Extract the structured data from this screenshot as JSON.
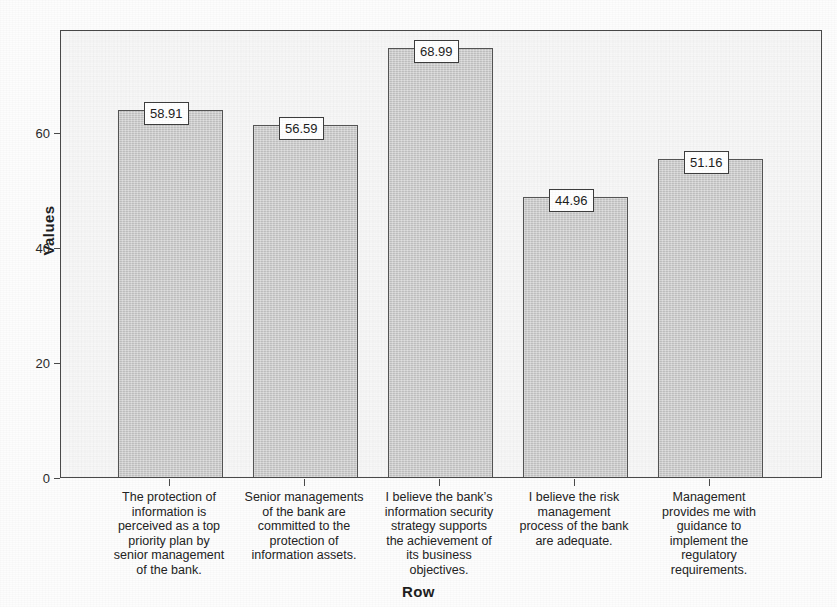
{
  "chart_data": {
    "type": "bar",
    "title": "",
    "xlabel": "Row",
    "ylabel": "Values",
    "ylim": [
      0,
      72
    ],
    "yticks": [
      0,
      20,
      40,
      60
    ],
    "ytick_labels": [
      "0",
      "20",
      "40",
      "60"
    ],
    "grid": false,
    "legend": false,
    "legend_position": "none",
    "categories": [
      "The protection of information is perceived as a top priority plan by senior management of the bank.",
      "Senior managements of the bank are committed to the protection of information assets.",
      "I believe the bank’s information security strategy supports the achievement of its business objectives.",
      "I believe the risk management process of the bank are adequate.",
      "Management provides me with guidance to implement the regulatory requirements."
    ],
    "category_lines": [
      [
        "The protection of",
        "information is",
        "perceived as a top",
        "priority plan by",
        "senior management",
        "of the bank."
      ],
      [
        "Senior managements",
        "of the bank are",
        "committed to the",
        "protection of",
        "information assets."
      ],
      [
        "I believe the bank’s",
        "information security",
        "strategy supports",
        "the achievement of",
        "its business",
        "objectives."
      ],
      [
        "I believe the risk",
        "management",
        "process of the bank",
        "are adequate."
      ],
      [
        "Management",
        "provides me with",
        "guidance to",
        "implement the",
        "regulatory",
        "requirements."
      ]
    ],
    "values": [
      58.91,
      56.59,
      68.99,
      44.96,
      51.16
    ],
    "value_labels": [
      "58.91",
      "56.59",
      "68.99",
      "44.96",
      "51.16"
    ],
    "bar_fill_color": "#c9c9c9",
    "bar_border_color": "#555555",
    "plot_background_color": "#f7f7f7",
    "axis_color": "#4a4a4a"
  }
}
